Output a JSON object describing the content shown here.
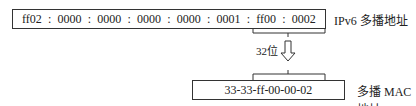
{
  "ipv6": {
    "groups": [
      "ff02",
      "0000",
      "0000",
      "0000",
      "0000",
      "0001",
      "ff00",
      "0002"
    ],
    "separator": ":",
    "label": "IPv6 多播地址"
  },
  "mapping": {
    "bits_label": "32位"
  },
  "mac": {
    "value": "33-33-ff-00-00-02",
    "label": "多播 MAC 地址"
  }
}
